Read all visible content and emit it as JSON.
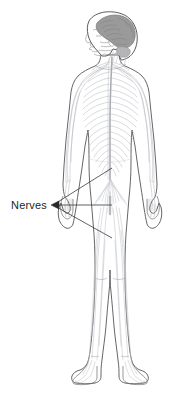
{
  "diagram": {
    "view": "posterior-full-body-with-left-profile-head",
    "background_color": "#ffffff",
    "title": "Nerves"
  },
  "labels": [
    {
      "id": "nerves",
      "text": "Nerves",
      "text_x": 11,
      "text_y": 209,
      "color": "#1f1f1f",
      "font_size": 11
    }
  ],
  "leader_lines": {
    "color": "#3a3a3a",
    "width": 0.8,
    "arrow_tip": {
      "x": 52,
      "y": 205
    },
    "arrowhead_color": "#2a2a2a",
    "lines": [
      {
        "id": "leader-upper",
        "x1": 53,
        "y1": 205,
        "x2": 112,
        "y2": 168
      },
      {
        "id": "leader-middle",
        "x1": 53,
        "y1": 205,
        "x2": 112,
        "y2": 205
      },
      {
        "id": "leader-lower",
        "x1": 53,
        "y1": 205,
        "x2": 112,
        "y2": 238
      }
    ]
  },
  "anatomy": {
    "body_outline_color": "#4a4a4a",
    "body_outline_width": 0.85,
    "body_fill": "#ffffff",
    "nerve_color": "#b9bcc2",
    "nerve_color_light": "#ccced3",
    "spinal_cord_color": "#a6a9af",
    "brain_fill": "#9a9a9a",
    "brain_outline": "#6d6d6d",
    "skull_outline": "#5a5a5a",
    "face_line_color": "#8e8e8e",
    "parts": [
      "brain",
      "skull",
      "face-profile",
      "spinal-cord",
      "cervical-nerves",
      "thoracic-nerves",
      "lumbar-nerves",
      "cauda-equina",
      "brachial-plexus",
      "arm-nerves",
      "hand-nerves",
      "sciatic-nerves",
      "leg-nerves",
      "foot-nerves",
      "torso-outline",
      "arms-outline",
      "legs-outline",
      "feet-outline"
    ]
  },
  "geometry": {
    "canvas_width": 179,
    "canvas_height": 401,
    "figure_center_x": 110,
    "head_top_y": 14,
    "feet_bottom_y": 388
  }
}
